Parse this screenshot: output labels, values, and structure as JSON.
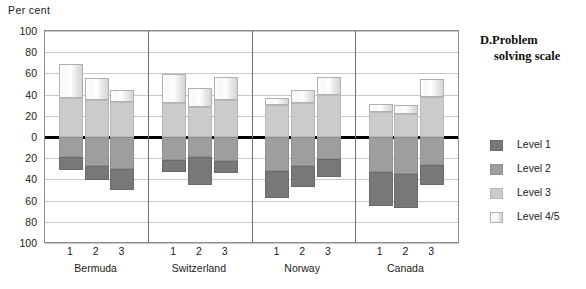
{
  "axis": {
    "unit_label": "Per cent",
    "y_ticks": [
      "100",
      "80",
      "60",
      "40",
      "20",
      "0",
      "20",
      "40",
      "60",
      "80",
      "100"
    ],
    "x_ticks": [
      "1",
      "2",
      "3",
      "1",
      "2",
      "3",
      "1",
      "2",
      "3",
      "1",
      "2",
      "3"
    ]
  },
  "legend": {
    "title_letter": "D.",
    "title_line1": "Problem",
    "title_line2": "solving scale",
    "items": [
      {
        "label": "Level 1",
        "color": "#787878"
      },
      {
        "label": "Level 2",
        "color": "#9e9e9e"
      },
      {
        "label": "Level 3",
        "color": "#cbcbcb"
      },
      {
        "label": "Level 4/5",
        "color": "#fdfdfd"
      }
    ]
  },
  "chart_data": {
    "type": "bar",
    "subtype": "diverging-stacked-bar",
    "xlabel": "",
    "ylabel": "Per cent",
    "ylim": [
      -100,
      100
    ],
    "y_tick_values": [
      100,
      80,
      60,
      40,
      20,
      0,
      -20,
      -40,
      -60,
      -80,
      -100
    ],
    "y_tick_labels": [
      "100",
      "80",
      "60",
      "40",
      "20",
      "0",
      "20",
      "40",
      "60",
      "80",
      "100"
    ],
    "grid": true,
    "legend_position": "right",
    "note": "Values above zero are Level 3 and Level 4/5; values below zero are Level 2 and Level 1 (plotted as magnitudes downward).",
    "groups": [
      "Bermuda",
      "Switzerland",
      "Norway",
      "Canada"
    ],
    "bars_per_group": [
      "1",
      "2",
      "3"
    ],
    "categories": [
      "Bermuda 1",
      "Bermuda 2",
      "Bermuda 3",
      "Switzerland 1",
      "Switzerland 2",
      "Switzerland 3",
      "Norway 1",
      "Norway 2",
      "Norway 3",
      "Canada 1",
      "Canada 2",
      "Canada 3"
    ],
    "series": [
      {
        "name": "Level 3",
        "direction": "up",
        "values": [
          37,
          35,
          33,
          32,
          28,
          35,
          30,
          32,
          40,
          24,
          22,
          38
        ]
      },
      {
        "name": "Level 4/5",
        "direction": "up",
        "values": [
          32,
          21,
          11,
          27,
          18,
          22,
          7,
          12,
          17,
          7,
          8,
          17
        ]
      },
      {
        "name": "Level 2",
        "direction": "down",
        "values": [
          19,
          27,
          30,
          22,
          19,
          23,
          32,
          27,
          21,
          33,
          35,
          26
        ]
      },
      {
        "name": "Level 1",
        "direction": "down",
        "values": [
          12,
          14,
          20,
          11,
          26,
          11,
          26,
          20,
          17,
          32,
          32,
          19
        ]
      }
    ],
    "bars": [
      {
        "group": "Bermuda",
        "bar": "1",
        "level3": 37,
        "level45": 32,
        "level2": 19,
        "level1": 12,
        "top_total": 69,
        "bottom_total": 31
      },
      {
        "group": "Bermuda",
        "bar": "2",
        "level3": 35,
        "level45": 21,
        "level2": 27,
        "level1": 14,
        "top_total": 56,
        "bottom_total": 41
      },
      {
        "group": "Bermuda",
        "bar": "3",
        "level3": 33,
        "level45": 11,
        "level2": 30,
        "level1": 20,
        "top_total": 44,
        "bottom_total": 50
      },
      {
        "group": "Switzerland",
        "bar": "1",
        "level3": 32,
        "level45": 27,
        "level2": 22,
        "level1": 11,
        "top_total": 59,
        "bottom_total": 33
      },
      {
        "group": "Switzerland",
        "bar": "2",
        "level3": 28,
        "level45": 18,
        "level2": 19,
        "level1": 26,
        "top_total": 46,
        "bottom_total": 45
      },
      {
        "group": "Switzerland",
        "bar": "3",
        "level3": 35,
        "level45": 22,
        "level2": 23,
        "level1": 11,
        "top_total": 57,
        "bottom_total": 34
      },
      {
        "group": "Norway",
        "bar": "1",
        "level3": 30,
        "level45": 7,
        "level2": 32,
        "level1": 26,
        "top_total": 37,
        "bottom_total": 58
      },
      {
        "group": "Norway",
        "bar": "2",
        "level3": 32,
        "level45": 12,
        "level2": 27,
        "level1": 20,
        "top_total": 44,
        "bottom_total": 47
      },
      {
        "group": "Norway",
        "bar": "3",
        "level3": 40,
        "level45": 17,
        "level2": 21,
        "level1": 17,
        "top_total": 57,
        "bottom_total": 38
      },
      {
        "group": "Canada",
        "bar": "1",
        "level3": 24,
        "level45": 7,
        "level2": 33,
        "level1": 32,
        "top_total": 31,
        "bottom_total": 65
      },
      {
        "group": "Canada",
        "bar": "2",
        "level3": 22,
        "level45": 8,
        "level2": 35,
        "level1": 32,
        "top_total": 30,
        "bottom_total": 67
      },
      {
        "group": "Canada",
        "bar": "3",
        "level3": 38,
        "level45": 17,
        "level2": 26,
        "level1": 19,
        "top_total": 55,
        "bottom_total": 45
      }
    ]
  }
}
